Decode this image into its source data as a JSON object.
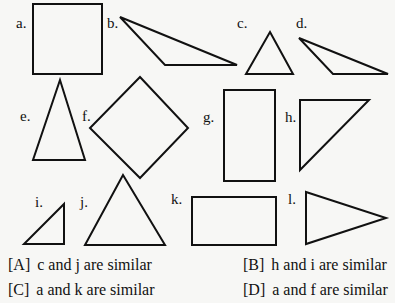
{
  "figure": {
    "stroke_color": "#111111",
    "shapes": [
      {
        "label": "a.",
        "type": "square",
        "points": "33,4 102,4 102,74 33,74",
        "label_pos": [
          16,
          16
        ]
      },
      {
        "label": "b.",
        "type": "obtuse-triangle",
        "points": "120,17 237,65 165,65",
        "label_pos": [
          108,
          16
        ]
      },
      {
        "label": "c.",
        "type": "triangle",
        "points": "270,32 293,74 246,74",
        "label_pos": [
          237,
          16
        ]
      },
      {
        "label": "d.",
        "type": "obtuse-triangle",
        "points": "299,38 388,74 333,74",
        "label_pos": [
          296,
          16
        ]
      },
      {
        "label": "e.",
        "type": "isosceles-triangle",
        "points": "60,80 85,160 33,160",
        "label_pos": [
          20,
          109
        ]
      },
      {
        "label": "f.",
        "type": "diamond",
        "points": "140,77 188,128 140,178 90,128",
        "label_pos": [
          82,
          109
        ]
      },
      {
        "label": "g.",
        "type": "rectangle",
        "points": "224,90 275,90 275,181 224,181",
        "label_pos": [
          204,
          110
        ]
      },
      {
        "label": "h.",
        "type": "right-triangle",
        "points": "300,100 369,100 300,170",
        "label_pos": [
          285,
          110
        ]
      },
      {
        "label": "i.",
        "type": "right-triangle",
        "points": "64,204 64,244 24,244",
        "label_pos": [
          35,
          195
        ]
      },
      {
        "label": "j.",
        "type": "triangle",
        "points": "123,175 165,245 85,245",
        "label_pos": [
          80,
          195
        ]
      },
      {
        "label": "k.",
        "type": "rectangle",
        "points": "192,197 276,197 276,245 192,245",
        "label_pos": [
          171,
          192
        ]
      },
      {
        "label": "l.",
        "type": "triangle",
        "points": "306,192 386,218 306,244",
        "label_pos": [
          287,
          192
        ]
      }
    ]
  },
  "options": [
    {
      "key": "[A]",
      "text": "c and j are similar",
      "pos": [
        8,
        254
      ]
    },
    {
      "key": "[B]",
      "text": "h and i are similar",
      "pos": [
        243,
        254
      ]
    },
    {
      "key": "[C]",
      "text": "a and k are similar",
      "pos": [
        8,
        279
      ]
    },
    {
      "key": "[D]",
      "text": "a and f are similar",
      "pos": [
        243,
        279
      ]
    }
  ]
}
